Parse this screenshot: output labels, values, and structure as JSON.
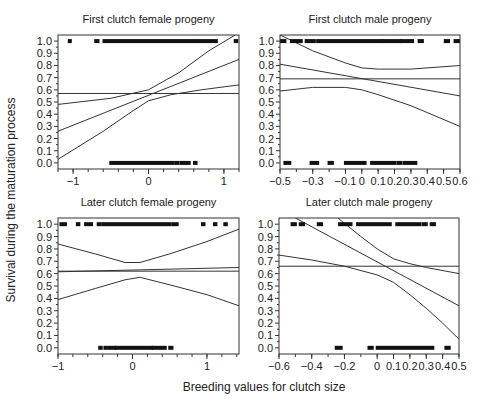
{
  "chart_data": [
    {
      "type": "scatter",
      "title": "First clutch female progeny",
      "xlabel": "Breeding values for clutch size",
      "ylabel": "Survival during the maturation process",
      "xlim": [
        -1.2,
        1.2
      ],
      "ylim": [
        -0.05,
        1.05
      ],
      "xticks": [
        -1,
        0,
        1
      ],
      "xtick_labels": [
        "−1",
        "0",
        "1"
      ],
      "xminor_step": 0.2,
      "yticks": [
        0.0,
        0.1,
        0.2,
        0.3,
        0.4,
        0.5,
        0.6,
        0.7,
        0.8,
        0.9,
        1.0
      ],
      "ytick_labels": [
        "0.0",
        "0.1",
        "0.2",
        "0.3",
        "0.4",
        "0.5",
        "0.6",
        "0.7",
        "0.8",
        "0.9",
        "1.0"
      ],
      "grid": false,
      "mean_line": 0.57,
      "fit_line": {
        "x": [
          -1.2,
          1.2
        ],
        "y": [
          0.26,
          0.85
        ]
      },
      "ci_upper": {
        "x": [
          -1.2,
          -0.5,
          0.0,
          0.4,
          0.8,
          1.15
        ],
        "y": [
          0.48,
          0.53,
          0.6,
          0.74,
          0.92,
          1.05
        ]
      },
      "ci_lower": {
        "x": [
          -1.2,
          -0.6,
          -0.2,
          0.0,
          0.3,
          0.7,
          1.2
        ],
        "y": [
          0.03,
          0.26,
          0.43,
          0.51,
          0.56,
          0.6,
          0.64
        ]
      },
      "points_y1": [
        [
          -1.05,
          -1.04
        ],
        [
          -0.7,
          -0.67
        ],
        [
          -0.59,
          0.65
        ],
        [
          0.68,
          0.9
        ],
        [
          1.15,
          1.17
        ]
      ],
      "points_y0": [
        [
          -0.5,
          0.32
        ],
        [
          0.36,
          0.39
        ],
        [
          0.43,
          0.54
        ],
        [
          0.61,
          0.63
        ]
      ]
    },
    {
      "type": "scatter",
      "title": "First clutch male progeny",
      "xlim": [
        -0.5,
        0.6
      ],
      "ylim": [
        -0.05,
        1.05
      ],
      "xticks": [
        -0.5,
        -0.3,
        -0.1,
        0,
        0.1,
        0.2,
        0.3,
        0.4,
        0.5,
        0.6
      ],
      "xtick_labels": [
        "−0.5",
        "−0.3",
        "−0.1",
        "0",
        "0.1",
        "0.2",
        "0.3",
        "0.4",
        "0.5",
        "0.6"
      ],
      "xminor_step": 0.1,
      "yticks": [
        0.0,
        0.1,
        0.2,
        0.3,
        0.4,
        0.5,
        0.6,
        0.7,
        0.8,
        0.9,
        1.0
      ],
      "ytick_labels": [
        "0.0",
        "0.1",
        "0.2",
        "0.3",
        "0.4",
        "0.5",
        "0.6",
        "0.7",
        "0.8",
        "0.9",
        "1.0"
      ],
      "grid": false,
      "mean_line": 0.69,
      "fit_line": {
        "x": [
          -0.5,
          0.6
        ],
        "y": [
          0.81,
          0.55
        ]
      },
      "ci_upper": {
        "x": [
          -0.5,
          -0.3,
          -0.1,
          0.0,
          0.1,
          0.3,
          0.6
        ],
        "y": [
          1.05,
          0.92,
          0.82,
          0.78,
          0.77,
          0.77,
          0.8
        ]
      },
      "ci_lower": {
        "x": [
          -0.5,
          -0.3,
          -0.1,
          0.0,
          0.1,
          0.3,
          0.6
        ],
        "y": [
          0.59,
          0.62,
          0.62,
          0.6,
          0.56,
          0.47,
          0.3
        ]
      },
      "points_y1": [
        [
          -0.49,
          -0.47
        ],
        [
          -0.43,
          -0.37
        ],
        [
          -0.34,
          -0.29
        ],
        [
          -0.27,
          0.12
        ],
        [
          0.13,
          0.23
        ],
        [
          0.24,
          0.31
        ],
        [
          0.35,
          0.37
        ],
        [
          0.51,
          0.53
        ],
        [
          0.57,
          0.59
        ]
      ],
      "points_y0": [
        [
          -0.47,
          -0.44
        ],
        [
          -0.31,
          -0.27
        ],
        [
          -0.2,
          -0.18
        ],
        [
          -0.1,
          0.02
        ],
        [
          0.06,
          0.2
        ],
        [
          0.22,
          0.24
        ],
        [
          0.26,
          0.33
        ]
      ]
    },
    {
      "type": "scatter",
      "title": "Later clutch female progeny",
      "xlim": [
        -1.0,
        1.43
      ],
      "ylim": [
        -0.05,
        1.05
      ],
      "xticks": [
        -1,
        0,
        1
      ],
      "xtick_labels": [
        "−1",
        "0",
        "1"
      ],
      "xminor_step": 0.2,
      "yticks": [
        0.0,
        0.1,
        0.2,
        0.3,
        0.4,
        0.5,
        0.6,
        0.7,
        0.8,
        0.9,
        1.0
      ],
      "ytick_labels": [
        "0.0",
        "0.1",
        "0.2",
        "0.3",
        "0.4",
        "0.5",
        "0.6",
        "0.7",
        "0.8",
        "0.9",
        "1.0"
      ],
      "grid": false,
      "mean_line": 0.62,
      "fit_line": {
        "x": [
          -1.0,
          1.43
        ],
        "y": [
          0.615,
          0.65
        ]
      },
      "ci_upper": {
        "x": [
          -1.0,
          -0.5,
          -0.1,
          0.1,
          0.5,
          1.0,
          1.43
        ],
        "y": [
          0.84,
          0.76,
          0.69,
          0.69,
          0.76,
          0.86,
          0.96
        ]
      },
      "ci_lower": {
        "x": [
          -1.0,
          -0.5,
          -0.1,
          0.1,
          0.5,
          1.0,
          1.43
        ],
        "y": [
          0.39,
          0.48,
          0.55,
          0.57,
          0.51,
          0.43,
          0.34
        ]
      },
      "points_y1": [
        [
          -0.96,
          -0.9
        ],
        [
          -0.74,
          -0.72
        ],
        [
          -0.63,
          -0.55
        ],
        [
          -0.46,
          -0.44
        ],
        [
          -0.4,
          0.5
        ],
        [
          0.54,
          0.6
        ],
        [
          0.94,
          0.96
        ],
        [
          1.1,
          1.12
        ],
        [
          1.24,
          1.26
        ]
      ],
      "points_y0": [
        [
          -0.44,
          -0.42
        ],
        [
          -0.37,
          -0.35
        ],
        [
          -0.31,
          -0.24
        ],
        [
          -0.22,
          0.26
        ],
        [
          0.28,
          0.44
        ],
        [
          0.5,
          0.53
        ]
      ]
    },
    {
      "type": "scatter",
      "title": "Later clutch male progeny",
      "xlim": [
        -0.6,
        0.5
      ],
      "ylim": [
        -0.05,
        1.05
      ],
      "xticks": [
        -0.6,
        -0.4,
        -0.2,
        0,
        0.1,
        0.2,
        0.3,
        0.4,
        0.5
      ],
      "xtick_labels": [
        "−0.6",
        "−0.4",
        "−0.2",
        "0",
        "0.1",
        "0.2",
        "0.3",
        "0.4",
        "0.5"
      ],
      "xminor_step": 0.1,
      "yticks": [
        0.0,
        0.1,
        0.2,
        0.3,
        0.4,
        0.5,
        0.6,
        0.7,
        0.8,
        0.9,
        1.0
      ],
      "ytick_labels": [
        "0.0",
        "0.1",
        "0.2",
        "0.3",
        "0.4",
        "0.5",
        "0.6",
        "0.7",
        "0.8",
        "0.9",
        "1.0"
      ],
      "grid": false,
      "mean_line": 0.66,
      "fit_line": {
        "x": [
          -0.5,
          0.5
        ],
        "y": [
          1.05,
          0.34
        ]
      },
      "ci_upper": {
        "x": [
          -0.24,
          -0.1,
          0.0,
          0.1,
          0.2,
          0.3,
          0.5
        ],
        "y": [
          1.05,
          0.9,
          0.8,
          0.72,
          0.68,
          0.65,
          0.6
        ]
      },
      "ci_lower": {
        "x": [
          -0.6,
          -0.4,
          -0.2,
          0.0,
          0.1,
          0.2,
          0.3,
          0.4,
          0.5
        ],
        "y": [
          0.75,
          0.71,
          0.66,
          0.59,
          0.53,
          0.43,
          0.32,
          0.2,
          0.07
        ]
      },
      "points_y1": [
        [
          -0.52,
          -0.5
        ],
        [
          -0.47,
          -0.45
        ],
        [
          -0.36,
          -0.34
        ],
        [
          -0.23,
          -0.16
        ],
        [
          -0.12,
          0.08
        ],
        [
          0.12,
          0.26
        ],
        [
          0.28,
          0.3
        ],
        [
          0.33,
          0.35
        ]
      ],
      "points_y0": [
        [
          -0.25,
          -0.22
        ],
        [
          -0.05,
          -0.03
        ],
        [
          0.0,
          0.34
        ],
        [
          0.42,
          0.44
        ]
      ]
    }
  ],
  "figure": {
    "xlabel": "Breeding values for clutch size",
    "ylabel": "Survival during the maturation process"
  }
}
